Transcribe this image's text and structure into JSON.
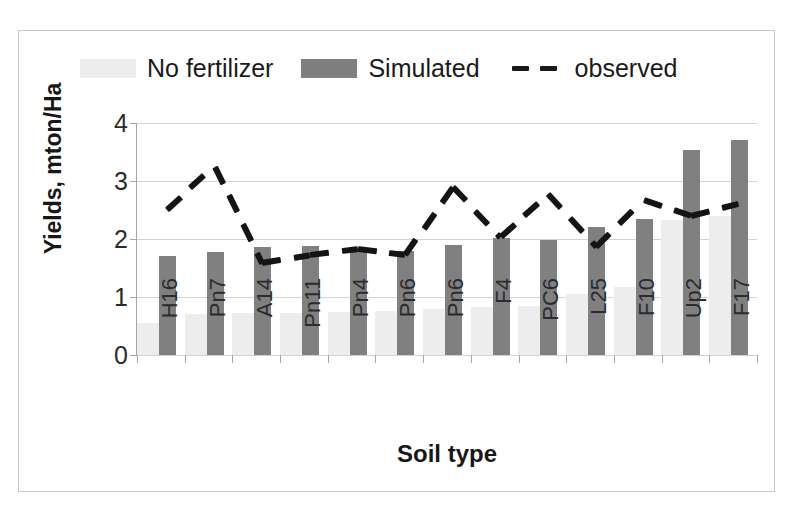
{
  "chart_data": {
    "type": "bar",
    "title": "",
    "xlabel": "Soil type",
    "ylabel": "Yields, mton/Ha",
    "ylim": [
      0,
      4
    ],
    "yticks": [
      0,
      1,
      2,
      3,
      4
    ],
    "grid": true,
    "legend_position": "top",
    "categories": [
      "H16",
      "Pn7",
      "A14",
      "Pn11",
      "Pn4",
      "Pn6",
      "Pn6",
      "F4",
      "PC6",
      "L25",
      "F10",
      "Up2",
      "F17"
    ],
    "series": [
      {
        "name": "No fertilizer",
        "type": "bar",
        "color": "#ededed",
        "values": [
          0.55,
          0.7,
          0.72,
          0.73,
          0.75,
          0.76,
          0.8,
          0.82,
          0.85,
          1.05,
          1.17,
          2.32,
          2.4
        ]
      },
      {
        "name": "Simulated",
        "type": "bar",
        "color": "#808080",
        "values": [
          1.71,
          1.77,
          1.86,
          1.88,
          1.83,
          1.8,
          1.9,
          2.02,
          1.99,
          2.21,
          2.34,
          3.54,
          3.7
        ]
      },
      {
        "name": "observed",
        "type": "line",
        "style": "dashed",
        "color": "#141414",
        "values": [
          2.5,
          3.25,
          1.58,
          1.72,
          1.82,
          1.72,
          2.89,
          2.03,
          2.77,
          1.87,
          2.68,
          2.4,
          2.61
        ]
      }
    ]
  },
  "legend": {
    "entries": [
      {
        "label": "No fertilizer",
        "marker": "swatch-light"
      },
      {
        "label": "Simulated",
        "marker": "swatch-gray"
      },
      {
        "label": "observed",
        "marker": "dashed-line"
      }
    ]
  },
  "axes": {
    "y_title": "Yields, mton/Ha",
    "x_title": "Soil type",
    "y_tick_labels": [
      "4",
      "3",
      "2",
      "1",
      "0"
    ]
  }
}
